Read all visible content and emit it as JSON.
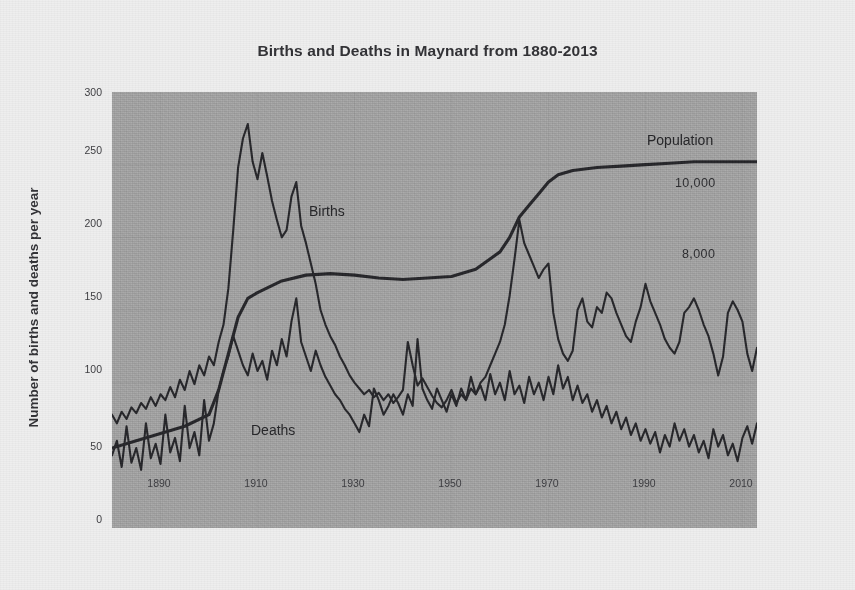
{
  "chart_data": {
    "type": "line",
    "title": "Births and Deaths in Maynard from 1880-2013",
    "xlabel": "",
    "ylabel": "Number of births and deaths per year",
    "xlim": [
      1880,
      2013
    ],
    "ylim": [
      0,
      300
    ],
    "yticks": [
      0,
      50,
      100,
      150,
      200,
      250,
      300
    ],
    "xticks": [
      1890,
      1910,
      1930,
      1950,
      1970,
      1990,
      2010
    ],
    "grid": true,
    "legend_position": "inline-annotations",
    "annotations": [
      {
        "text": "Births",
        "x": 1925,
        "y": 215
      },
      {
        "text": "Deaths",
        "x": 1908,
        "y": 40
      },
      {
        "text": "Population",
        "x": 1992,
        "y": 262
      },
      {
        "text": "10,000",
        "x": 1999,
        "y": 228
      },
      {
        "text": "8,000",
        "x": 1999,
        "y": 180
      }
    ],
    "series": [
      {
        "name": "Births",
        "color": "#26262a",
        "x": [
          1880,
          1881,
          1882,
          1883,
          1884,
          1885,
          1886,
          1887,
          1888,
          1889,
          1890,
          1891,
          1892,
          1893,
          1894,
          1895,
          1896,
          1897,
          1898,
          1899,
          1900,
          1901,
          1902,
          1903,
          1904,
          1905,
          1906,
          1907,
          1908,
          1909,
          1910,
          1911,
          1912,
          1913,
          1914,
          1915,
          1916,
          1917,
          1918,
          1919,
          1920,
          1921,
          1922,
          1923,
          1924,
          1925,
          1926,
          1927,
          1928,
          1929,
          1930,
          1931,
          1932,
          1933,
          1934,
          1935,
          1936,
          1937,
          1938,
          1939,
          1940,
          1941,
          1942,
          1943,
          1944,
          1945,
          1946,
          1947,
          1948,
          1949,
          1950,
          1951,
          1952,
          1953,
          1954,
          1955,
          1956,
          1957,
          1958,
          1959,
          1960,
          1961,
          1962,
          1963,
          1964,
          1965,
          1966,
          1967,
          1968,
          1969,
          1970,
          1971,
          1972,
          1973,
          1974,
          1975,
          1976,
          1977,
          1978,
          1979,
          1980,
          1981,
          1982,
          1983,
          1984,
          1985,
          1986,
          1987,
          1988,
          1989,
          1990,
          1991,
          1992,
          1993,
          1994,
          1995,
          1996,
          1997,
          1998,
          1999,
          2000,
          2001,
          2002,
          2003,
          2004,
          2005,
          2006,
          2007,
          2008,
          2009,
          2010,
          2011,
          2012,
          2013
        ],
        "y": [
          78,
          72,
          80,
          75,
          83,
          79,
          86,
          82,
          90,
          84,
          92,
          88,
          97,
          90,
          102,
          95,
          108,
          99,
          112,
          105,
          118,
          112,
          128,
          140,
          165,
          205,
          248,
          268,
          278,
          252,
          240,
          258,
          242,
          225,
          212,
          200,
          205,
          228,
          238,
          208,
          196,
          182,
          168,
          150,
          140,
          132,
          126,
          118,
          112,
          105,
          100,
          96,
          92,
          95,
          90,
          93,
          88,
          92,
          86,
          90,
          95,
          128,
          112,
          98,
          103,
          97,
          91,
          86,
          83,
          88,
          95,
          86,
          92,
          88,
          96,
          92,
          100,
          104,
          112,
          120,
          128,
          140,
          160,
          185,
          212,
          196,
          188,
          180,
          172,
          178,
          182,
          148,
          130,
          120,
          115,
          122,
          150,
          158,
          142,
          138,
          152,
          148,
          162,
          158,
          148,
          140,
          132,
          128,
          142,
          152,
          168,
          156,
          148,
          140,
          130,
          124,
          120,
          128,
          148,
          152,
          158,
          150,
          140,
          132,
          120,
          105,
          118,
          148,
          156,
          150,
          142,
          120,
          108,
          124
        ]
      },
      {
        "name": "Deaths",
        "color": "#26262a",
        "x": [
          1880,
          1881,
          1882,
          1883,
          1884,
          1885,
          1886,
          1887,
          1888,
          1889,
          1890,
          1891,
          1892,
          1893,
          1894,
          1895,
          1896,
          1897,
          1898,
          1899,
          1900,
          1901,
          1902,
          1903,
          1904,
          1905,
          1906,
          1907,
          1908,
          1909,
          1910,
          1911,
          1912,
          1913,
          1914,
          1915,
          1916,
          1917,
          1918,
          1919,
          1920,
          1921,
          1922,
          1923,
          1924,
          1925,
          1926,
          1927,
          1928,
          1929,
          1930,
          1931,
          1932,
          1933,
          1934,
          1935,
          1936,
          1937,
          1938,
          1939,
          1940,
          1941,
          1942,
          1943,
          1944,
          1945,
          1946,
          1947,
          1948,
          1949,
          1950,
          1951,
          1952,
          1953,
          1954,
          1955,
          1956,
          1957,
          1958,
          1959,
          1960,
          1961,
          1962,
          1963,
          1964,
          1965,
          1966,
          1967,
          1968,
          1969,
          1970,
          1971,
          1972,
          1973,
          1974,
          1975,
          1976,
          1977,
          1978,
          1979,
          1980,
          1981,
          1982,
          1983,
          1984,
          1985,
          1986,
          1987,
          1988,
          1989,
          1990,
          1991,
          1992,
          1993,
          1994,
          1995,
          1996,
          1997,
          1998,
          1999,
          2000,
          2001,
          2002,
          2003,
          2004,
          2005,
          2006,
          2007,
          2008,
          2009,
          2010,
          2011,
          2012,
          2013
        ],
        "y": [
          50,
          60,
          42,
          70,
          45,
          55,
          40,
          72,
          48,
          58,
          44,
          78,
          52,
          62,
          46,
          84,
          55,
          66,
          50,
          88,
          60,
          72,
          95,
          108,
          118,
          132,
          122,
          112,
          105,
          120,
          108,
          115,
          102,
          122,
          112,
          130,
          118,
          142,
          158,
          128,
          118,
          108,
          122,
          112,
          104,
          98,
          92,
          88,
          82,
          78,
          72,
          66,
          78,
          70,
          96,
          88,
          78,
          84,
          92,
          86,
          78,
          92,
          84,
          130,
          96,
          88,
          82,
          96,
          88,
          80,
          92,
          84,
          96,
          88,
          104,
          92,
          98,
          88,
          106,
          92,
          100,
          88,
          108,
          92,
          98,
          86,
          104,
          92,
          100,
          88,
          104,
          92,
          112,
          96,
          104,
          88,
          98,
          86,
          92,
          80,
          88,
          76,
          84,
          72,
          80,
          68,
          76,
          64,
          72,
          60,
          68,
          58,
          66,
          52,
          64,
          56,
          72,
          60,
          68,
          56,
          64,
          52,
          60,
          48,
          68,
          56,
          64,
          50,
          58,
          46,
          62,
          70,
          58,
          72
        ]
      },
      {
        "name": "Population",
        "color": "#26262a",
        "units": "people",
        "y_scale_note": "Plotted on a secondary scale; 10,000 and 8,000 labeled at right",
        "x": [
          1880,
          1885,
          1890,
          1895,
          1900,
          1902,
          1904,
          1906,
          1908,
          1910,
          1915,
          1920,
          1925,
          1930,
          1935,
          1940,
          1945,
          1950,
          1955,
          1960,
          1962,
          1964,
          1966,
          1968,
          1970,
          1972,
          1975,
          1980,
          1985,
          1990,
          1995,
          2000,
          2005,
          2010,
          2013
        ],
        "y": [
          55,
          60,
          65,
          70,
          78,
          95,
          120,
          145,
          158,
          162,
          170,
          174,
          175,
          174,
          172,
          171,
          172,
          173,
          178,
          190,
          200,
          214,
          222,
          230,
          238,
          243,
          246,
          248,
          249,
          250,
          251,
          252,
          252,
          252,
          252
        ]
      }
    ]
  },
  "axis": {
    "yticks": [
      "300",
      "250",
      "200",
      "150",
      "100",
      "50",
      "0"
    ],
    "xticks": [
      "1890",
      "1910",
      "1930",
      "1950",
      "1970",
      "1990",
      "2010"
    ]
  },
  "labels": {
    "title": "Births and Deaths in Maynard from 1880-2013",
    "ylabel": "Number of births and deaths per year",
    "births": "Births",
    "deaths": "Deaths",
    "population": "Population",
    "pop_10000": "10,000",
    "pop_8000": "8,000"
  },
  "colors": {
    "page_background": "#eeeeee",
    "plot_background": "#a9a9a9",
    "line": "#26262a",
    "text": "#2f2f33",
    "gridline": "#9a9a9a"
  }
}
